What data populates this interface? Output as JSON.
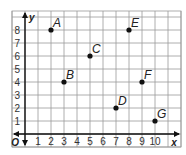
{
  "chart_data": {
    "type": "scatter",
    "title": "",
    "xlabel": "x",
    "ylabel": "y",
    "origin_label": "O",
    "xlim": [
      0,
      11
    ],
    "ylim": [
      -1,
      9
    ],
    "x_ticks": [
      "1",
      "2",
      "3",
      "4",
      "5",
      "6",
      "7",
      "8",
      "9",
      "10"
    ],
    "y_ticks": [
      "1",
      "2",
      "3",
      "4",
      "5",
      "6",
      "7",
      "8"
    ],
    "grid": true,
    "points": [
      {
        "label": "A",
        "x": 2,
        "y": 8
      },
      {
        "label": "B",
        "x": 3,
        "y": 4
      },
      {
        "label": "C",
        "x": 5,
        "y": 6
      },
      {
        "label": "D",
        "x": 7,
        "y": 2
      },
      {
        "label": "E",
        "x": 8,
        "y": 8
      },
      {
        "label": "F",
        "x": 9,
        "y": 4
      },
      {
        "label": "G",
        "x": 10,
        "y": 1
      }
    ]
  },
  "colors": {
    "grid": "#9a9a9a",
    "axis": "#111111",
    "point": "#111111"
  }
}
